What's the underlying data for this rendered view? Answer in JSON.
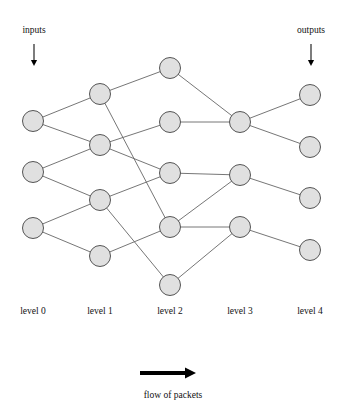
{
  "diagram": {
    "canvas": {
      "width": 346,
      "height": 415
    },
    "annotations": {
      "inputs_label": "inputs",
      "outputs_label": "outputs",
      "flow_label": "flow of packets"
    },
    "level_labels": [
      {
        "id": "level-0",
        "text": "level 0",
        "x": 33,
        "y": 314
      },
      {
        "id": "level-1",
        "text": "level 1",
        "x": 100,
        "y": 314
      },
      {
        "id": "level-2",
        "text": "level 2",
        "x": 170,
        "y": 314
      },
      {
        "id": "level-3",
        "text": "level 3",
        "x": 240,
        "y": 314
      },
      {
        "id": "level-4",
        "text": "level 4",
        "x": 310,
        "y": 314
      }
    ],
    "node_style": {
      "radius": 10.5,
      "fill": "#e0e0e0",
      "stroke": "#555555"
    },
    "edge_style": {
      "stroke": "#666666",
      "width": 0.9
    },
    "levels": [
      {
        "level": 0,
        "x": 33,
        "nodes": [
          {
            "id": "n0-0",
            "y": 121
          },
          {
            "id": "n0-1",
            "y": 172
          },
          {
            "id": "n0-2",
            "y": 228
          }
        ]
      },
      {
        "level": 1,
        "x": 100,
        "nodes": [
          {
            "id": "n1-0",
            "y": 94
          },
          {
            "id": "n1-1",
            "y": 145
          },
          {
            "id": "n1-2",
            "y": 200
          },
          {
            "id": "n1-3",
            "y": 256
          }
        ]
      },
      {
        "level": 2,
        "x": 170,
        "nodes": [
          {
            "id": "n2-0",
            "y": 68
          },
          {
            "id": "n2-1",
            "y": 122
          },
          {
            "id": "n2-2",
            "y": 173
          },
          {
            "id": "n2-3",
            "y": 227
          },
          {
            "id": "n2-4",
            "y": 285
          }
        ]
      },
      {
        "level": 3,
        "x": 240,
        "nodes": [
          {
            "id": "n3-0",
            "y": 122
          },
          {
            "id": "n3-1",
            "y": 175
          },
          {
            "id": "n3-2",
            "y": 227
          }
        ]
      },
      {
        "level": 4,
        "x": 310,
        "nodes": [
          {
            "id": "n4-0",
            "y": 95
          },
          {
            "id": "n4-1",
            "y": 147
          },
          {
            "id": "n4-2",
            "y": 198
          },
          {
            "id": "n4-3",
            "y": 250
          }
        ]
      }
    ],
    "edges": [
      {
        "from": "n0-0",
        "to": "n1-0"
      },
      {
        "from": "n0-0",
        "to": "n1-1"
      },
      {
        "from": "n0-1",
        "to": "n1-1"
      },
      {
        "from": "n0-1",
        "to": "n1-2"
      },
      {
        "from": "n0-2",
        "to": "n1-2"
      },
      {
        "from": "n0-2",
        "to": "n1-3"
      },
      {
        "from": "n1-0",
        "to": "n2-0"
      },
      {
        "from": "n1-0",
        "to": "n2-3"
      },
      {
        "from": "n1-1",
        "to": "n2-1"
      },
      {
        "from": "n1-1",
        "to": "n2-2"
      },
      {
        "from": "n1-2",
        "to": "n2-2"
      },
      {
        "from": "n1-2",
        "to": "n2-4"
      },
      {
        "from": "n1-3",
        "to": "n2-3"
      },
      {
        "from": "n2-0",
        "to": "n3-0"
      },
      {
        "from": "n2-1",
        "to": "n3-0"
      },
      {
        "from": "n2-2",
        "to": "n3-1"
      },
      {
        "from": "n2-3",
        "to": "n3-1"
      },
      {
        "from": "n2-3",
        "to": "n3-2"
      },
      {
        "from": "n2-4",
        "to": "n3-2"
      },
      {
        "from": "n3-0",
        "to": "n4-0"
      },
      {
        "from": "n3-0",
        "to": "n4-1"
      },
      {
        "from": "n3-1",
        "to": "n4-2"
      },
      {
        "from": "n3-2",
        "to": "n4-3"
      }
    ],
    "input_marker": {
      "label_x": 34,
      "label_y": 33,
      "arrow_x": 34,
      "arrow_y0": 44,
      "arrow_y1": 66
    },
    "output_marker": {
      "label_x": 311,
      "label_y": 33,
      "arrow_x": 311,
      "arrow_y0": 44,
      "arrow_y1": 66
    },
    "flow_arrow": {
      "x0": 140,
      "x1": 196,
      "y": 373,
      "label_x": 173,
      "label_y": 398
    }
  }
}
